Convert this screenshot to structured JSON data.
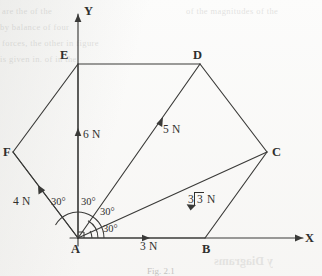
{
  "figure": {
    "type": "vector-polygon-force-diagram",
    "caption": "Fig. 2.1",
    "background_color": "#fbfbfa",
    "ink_color": "#3a3a38"
  },
  "axes": {
    "x_label": "X",
    "y_label": "Y",
    "origin_label": "A"
  },
  "vertices": [
    {
      "id": "A",
      "label": "A",
      "x": 78,
      "y": 238
    },
    {
      "id": "B",
      "label": "B",
      "x": 205,
      "y": 238
    },
    {
      "id": "C",
      "label": "C",
      "x": 267,
      "y": 152
    },
    {
      "id": "D",
      "label": "D",
      "x": 200,
      "y": 64
    },
    {
      "id": "E",
      "label": "E",
      "x": 78,
      "y": 64
    },
    {
      "id": "F",
      "label": "F",
      "x": 13,
      "y": 152
    }
  ],
  "forces": [
    {
      "name": "AB",
      "label": "3 N",
      "magnitude": 3,
      "angle_deg": 0,
      "from": "A",
      "to": "B"
    },
    {
      "name": "AC",
      "label": "3√3 N",
      "magnitude": 5.196,
      "angle_deg": 30,
      "from": "A",
      "to": "C",
      "radical": {
        "coefficient": "3",
        "radicand": "3",
        "unit": "N"
      }
    },
    {
      "name": "AD",
      "label": "5 N",
      "magnitude": 5,
      "angle_deg": 60,
      "from": "A",
      "to": "D"
    },
    {
      "name": "AE",
      "label": "6 N",
      "magnitude": 6,
      "angle_deg": 90,
      "from": "A",
      "to": "E"
    },
    {
      "name": "AF",
      "label": "4 N",
      "magnitude": 4,
      "angle_deg": 150,
      "from": "A",
      "to": "F"
    }
  ],
  "angles": [
    {
      "id": "angle-AB-AC",
      "label": "30°",
      "between": [
        "AB",
        "AC"
      ]
    },
    {
      "id": "angle-AC-AD",
      "label": "30°",
      "between": [
        "AC",
        "AD"
      ]
    },
    {
      "id": "angle-AD-AE",
      "label": "30°",
      "between": [
        "AD",
        "AE"
      ]
    },
    {
      "id": "angle-AE-AF",
      "label": "30°",
      "between": [
        "AE",
        "AF"
      ]
    }
  ],
  "ghost_text": {
    "mirrored_line": "y Diagrams",
    "faint_lines": [
      "are the of the",
      "by balance of four",
      "forces, the other in figure",
      "is given in. of in the",
      "of the magnitudes of the"
    ]
  }
}
